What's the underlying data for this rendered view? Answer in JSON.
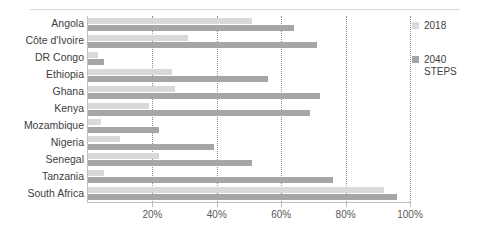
{
  "chart_data": {
    "type": "bar",
    "orientation": "horizontal",
    "title": "",
    "xlabel": "",
    "ylabel": "",
    "xlim": [
      0,
      100
    ],
    "xticks": [
      20,
      40,
      60,
      80,
      100
    ],
    "xtick_labels": [
      "20%",
      "40%",
      "60%",
      "80%",
      "100%"
    ],
    "grid": "vertical-dotted",
    "legend_position": "right",
    "categories": [
      "Angola",
      "Côte d'Ivoire",
      "DR Congo",
      "Ethiopia",
      "Ghana",
      "Kenya",
      "Mozambique",
      "Nigeria",
      "Senegal",
      "Tanzania",
      "South Africa"
    ],
    "series": [
      {
        "name": "2018",
        "color": "#d9d9d9",
        "values": [
          51,
          31,
          3,
          26,
          27,
          19,
          4,
          10,
          22,
          5,
          92
        ]
      },
      {
        "name": "2040 STEPS",
        "color": "#a6a6a6",
        "values": [
          64,
          71,
          5,
          56,
          72,
          69,
          22,
          39,
          51,
          76,
          96
        ]
      }
    ]
  },
  "legend": {
    "items": [
      {
        "label": "2018",
        "color": "#d9d9d9"
      },
      {
        "label": "2040\nSTEPS",
        "color": "#a6a6a6"
      }
    ]
  },
  "title_clip": {
    "text": ""
  }
}
